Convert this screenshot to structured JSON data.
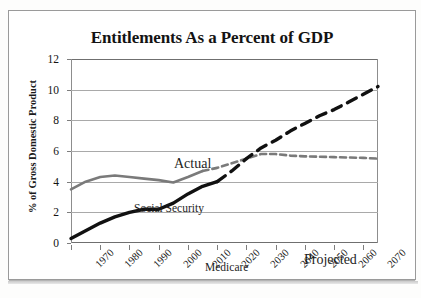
{
  "chart_data": {
    "type": "line",
    "title": "Entitlements As a Percent of GDP",
    "xlabel": "",
    "ylabel": "% of Gross Domestic Product",
    "xlim": [
      1970,
      2075
    ],
    "ylim": [
      0,
      12
    ],
    "yticks": [
      0,
      2,
      4,
      6,
      8,
      10,
      12
    ],
    "xticks": [
      1970,
      1980,
      1990,
      2000,
      2010,
      2020,
      2030,
      2040,
      2050,
      2060,
      2070
    ],
    "grid": true,
    "legend_position": "inline-annotations",
    "annotations": [
      {
        "text": "Actual",
        "x": 1992,
        "y": 8.0
      },
      {
        "text": "Projected",
        "x": 2038,
        "y": 1.8
      },
      {
        "text": "Social Security",
        "x": 1971,
        "y": 5.2
      },
      {
        "text": "Medicare",
        "x": 1996,
        "y": 1.3
      }
    ],
    "series": [
      {
        "name": "Social Security",
        "color": "#7a7a7a",
        "actual": {
          "x": [
            1970,
            1975,
            1980,
            1985,
            1990,
            1995,
            2000,
            2005,
            2010,
            2015
          ],
          "y": [
            3.5,
            4.0,
            4.3,
            4.4,
            4.3,
            4.2,
            4.1,
            3.95,
            4.3,
            4.7
          ]
        },
        "projected": {
          "x": [
            2015,
            2020,
            2025,
            2030,
            2035,
            2040,
            2045,
            2050,
            2060,
            2070,
            2075
          ],
          "y": [
            4.7,
            4.9,
            5.2,
            5.5,
            5.8,
            5.8,
            5.7,
            5.65,
            5.6,
            5.55,
            5.5
          ]
        }
      },
      {
        "name": "Medicare",
        "color": "#111111",
        "actual": {
          "x": [
            1970,
            1975,
            1980,
            1985,
            1990,
            1995,
            2000,
            2005,
            2010,
            2015,
            2020
          ],
          "y": [
            0.3,
            0.8,
            1.3,
            1.7,
            2.0,
            2.2,
            2.2,
            2.6,
            3.2,
            3.7,
            4.0
          ]
        },
        "projected": {
          "x": [
            2020,
            2025,
            2030,
            2035,
            2040,
            2045,
            2050,
            2055,
            2060,
            2065,
            2070,
            2075
          ],
          "y": [
            4.0,
            4.7,
            5.5,
            6.2,
            6.7,
            7.3,
            7.8,
            8.3,
            8.7,
            9.2,
            9.7,
            10.2
          ]
        }
      }
    ]
  }
}
